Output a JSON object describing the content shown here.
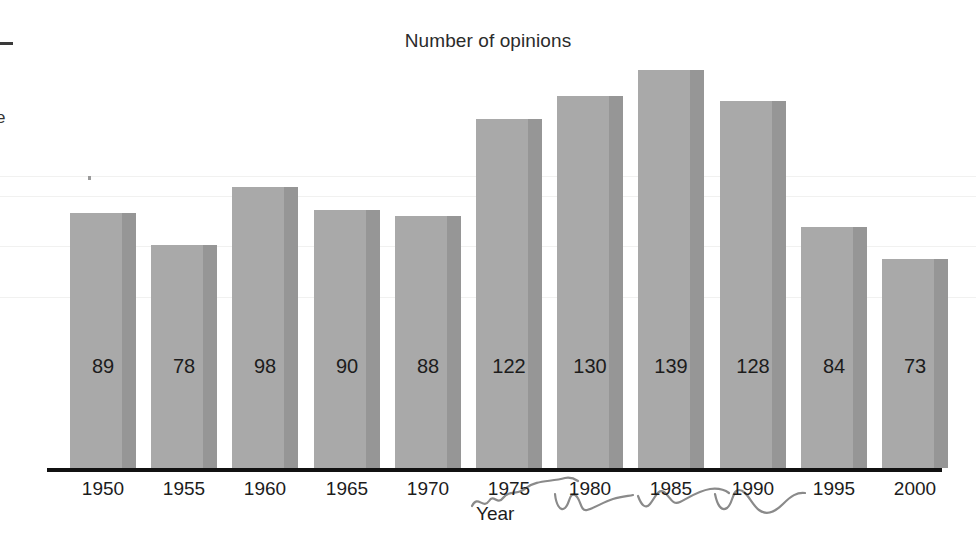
{
  "chart_data": {
    "type": "bar",
    "title": "Number of opinions",
    "xlabel": "Year",
    "ylabel": "",
    "categories": [
      "1950",
      "1955",
      "1960",
      "1965",
      "1970",
      "1975",
      "1980",
      "1985",
      "1990",
      "1995",
      "2000"
    ],
    "values": [
      89,
      78,
      98,
      90,
      88,
      122,
      130,
      139,
      128,
      84,
      73
    ],
    "value_labels": [
      "89",
      "78",
      "98",
      "90",
      "88",
      "122",
      "130",
      "139",
      "128",
      "84",
      "73"
    ],
    "ylim": [
      0,
      145
    ],
    "grid": false,
    "legend": null,
    "bar_color": "#a9a9a9",
    "bar_shade_color": "#969696",
    "axis_color": "#111111",
    "text_color": "#1c1c1c"
  },
  "annotations": {
    "handwriting_note": "pencil scribbles over 1975-1990 tick labels",
    "edge_artifact_glyph": "e"
  }
}
